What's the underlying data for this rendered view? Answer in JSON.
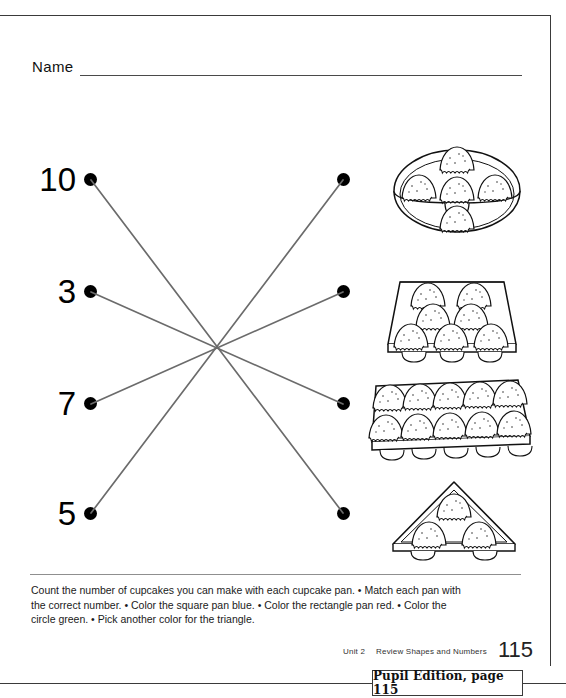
{
  "worksheet": {
    "name_label": "Name",
    "numbers": [
      {
        "value": "10",
        "dot": "number-dot-10"
      },
      {
        "value": "3",
        "dot": "number-dot-3"
      },
      {
        "value": "7",
        "dot": "number-dot-7"
      },
      {
        "value": "5",
        "dot": "number-dot-5"
      }
    ],
    "pans": [
      {
        "shape": "circle",
        "cupcakes": 5,
        "label": "circle cupcake pan"
      },
      {
        "shape": "square",
        "cupcakes": 7,
        "label": "square cupcake pan"
      },
      {
        "shape": "rectangle",
        "cupcakes": 10,
        "label": "rectangle cupcake pan"
      },
      {
        "shape": "triangle",
        "cupcakes": 3,
        "label": "triangle cupcake pan"
      }
    ],
    "matches": [
      {
        "from": "10",
        "to": "rectangle"
      },
      {
        "from": "3",
        "to": "rectangle-row-3"
      },
      {
        "from": "7",
        "to": "square"
      },
      {
        "from": "5",
        "to": "circle"
      }
    ],
    "instructions": "Count the number of cupcakes you can make with each cupcake pan. • Match each pan with the correct number. • Color the square pan blue. • Color the rectangle pan red. • Color the circle green. • Pick another color for the triangle."
  },
  "footer": {
    "unit": "Unit 2",
    "section": "Review Shapes and Numbers",
    "page_number": "115"
  },
  "badge": {
    "text": "Pupil Edition, page 115"
  },
  "colors": {
    "ink": "#000000",
    "rule": "#3a3a3a",
    "connector": "#6b6b6b"
  }
}
